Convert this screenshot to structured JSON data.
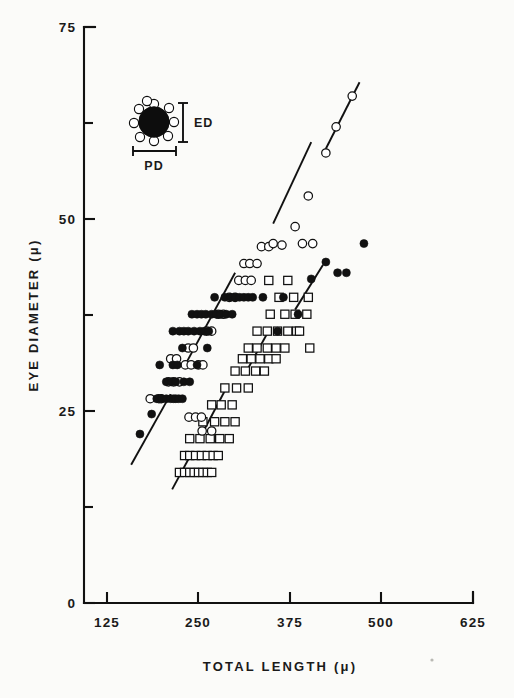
{
  "figure": {
    "background_color": "#fbfbf9",
    "ink_color": "#111111"
  },
  "chart_data": {
    "type": "scatter",
    "title": "",
    "xlabel": "TOTAL LENGTH (μ)",
    "ylabel": "EYE DIAMETER (μ)",
    "xlim": [
      0,
      625
    ],
    "ylim": [
      0,
      75
    ],
    "xticks": [
      125,
      250,
      375,
      500,
      625
    ],
    "xtick_labels": [
      "125",
      "250",
      "375",
      "500",
      "625"
    ],
    "yticks": [
      0,
      25,
      50,
      75
    ],
    "ytick_labels": [
      "0",
      "25",
      "50",
      "75"
    ],
    "yticks_minor": [
      12.5,
      37.5,
      62.5
    ],
    "grid": false,
    "legend": "none",
    "axis_origin_label": "0",
    "series": [
      {
        "name": "filled-circle-series",
        "marker": "filled-circle",
        "color": "#111111",
        "points": [
          [
            170,
            22.0
          ],
          [
            186,
            24.6
          ],
          [
            193,
            26.6
          ],
          [
            200,
            26.6
          ],
          [
            206,
            26.6
          ],
          [
            212,
            26.6
          ],
          [
            216,
            26.6
          ],
          [
            219,
            26.6
          ],
          [
            223,
            26.6
          ],
          [
            228,
            26.6
          ],
          [
            206,
            28.8
          ],
          [
            213,
            28.8
          ],
          [
            219,
            28.8
          ],
          [
            230,
            28.8
          ],
          [
            238,
            28.8
          ],
          [
            197,
            31.0
          ],
          [
            215,
            31.0
          ],
          [
            221,
            31.0
          ],
          [
            248,
            31.0
          ],
          [
            228,
            33.2
          ],
          [
            262,
            33.2
          ],
          [
            215,
            35.4
          ],
          [
            224,
            35.4
          ],
          [
            230,
            35.4
          ],
          [
            236,
            35.4
          ],
          [
            244,
            35.4
          ],
          [
            252,
            35.4
          ],
          [
            258,
            35.4
          ],
          [
            264,
            35.4
          ],
          [
            241,
            37.6
          ],
          [
            248,
            37.6
          ],
          [
            254,
            37.6
          ],
          [
            260,
            37.6
          ],
          [
            268,
            37.6
          ],
          [
            274,
            37.6
          ],
          [
            280,
            37.6
          ],
          [
            288,
            37.6
          ],
          [
            296,
            37.6
          ],
          [
            272,
            39.8
          ],
          [
            286,
            39.8
          ],
          [
            294,
            39.8
          ],
          [
            300,
            39.8
          ],
          [
            306,
            39.8
          ],
          [
            312,
            39.8
          ],
          [
            318,
            39.8
          ],
          [
            324,
            39.8
          ],
          [
            338,
            39.8
          ],
          [
            366,
            39.8
          ],
          [
            404,
            42.2
          ],
          [
            424,
            44.4
          ],
          [
            440,
            43.0
          ],
          [
            452,
            43.0
          ],
          [
            476,
            46.8
          ],
          [
            386,
            37.6
          ],
          [
            358,
            35.4
          ]
        ]
      },
      {
        "name": "open-circle-series",
        "marker": "open-circle",
        "color": "#111111",
        "points": [
          [
            184,
            26.6
          ],
          [
            196,
            26.6
          ],
          [
            199,
            26.6
          ],
          [
            209,
            28.8
          ],
          [
            216,
            28.8
          ],
          [
            224,
            28.8
          ],
          [
            232,
            31.0
          ],
          [
            240,
            31.0
          ],
          [
            250,
            31.0
          ],
          [
            256,
            31.0
          ],
          [
            212,
            31.8
          ],
          [
            220,
            31.8
          ],
          [
            237,
            24.2
          ],
          [
            246,
            24.2
          ],
          [
            254,
            24.2
          ],
          [
            255,
            22.4
          ],
          [
            268,
            22.4
          ],
          [
            236,
            33.2
          ],
          [
            243,
            33.2
          ],
          [
            261,
            35.4
          ],
          [
            268,
            35.4
          ],
          [
            277,
            37.6
          ],
          [
            284,
            37.6
          ],
          [
            292,
            39.8
          ],
          [
            300,
            39.8
          ],
          [
            305,
            42.0
          ],
          [
            314,
            42.0
          ],
          [
            322,
            42.0
          ],
          [
            312,
            44.2
          ],
          [
            320,
            44.2
          ],
          [
            330,
            44.2
          ],
          [
            336,
            46.4
          ],
          [
            346,
            46.4
          ],
          [
            352,
            46.8
          ],
          [
            364,
            46.6
          ],
          [
            382,
            49.0
          ],
          [
            400,
            53.0
          ],
          [
            424,
            58.6
          ],
          [
            438,
            62.0
          ],
          [
            460,
            66.0
          ],
          [
            392,
            46.8
          ],
          [
            406,
            46.8
          ]
        ]
      },
      {
        "name": "open-square-series",
        "marker": "open-square",
        "color": "#111111",
        "points": [
          [
            224,
            17.0
          ],
          [
            231,
            17.0
          ],
          [
            238,
            17.0
          ],
          [
            244,
            17.0
          ],
          [
            250,
            17.0
          ],
          [
            256,
            17.0
          ],
          [
            262,
            17.0
          ],
          [
            268,
            17.0
          ],
          [
            231,
            19.2
          ],
          [
            238,
            19.2
          ],
          [
            246,
            19.2
          ],
          [
            254,
            19.2
          ],
          [
            262,
            19.2
          ],
          [
            270,
            19.2
          ],
          [
            277,
            19.2
          ],
          [
            238,
            21.4
          ],
          [
            252,
            21.4
          ],
          [
            266,
            21.4
          ],
          [
            279,
            21.4
          ],
          [
            292,
            21.4
          ],
          [
            256,
            23.6
          ],
          [
            272,
            23.6
          ],
          [
            286,
            23.6
          ],
          [
            300,
            23.6
          ],
          [
            268,
            25.8
          ],
          [
            281,
            25.8
          ],
          [
            296,
            25.8
          ],
          [
            286,
            28.0
          ],
          [
            302,
            28.0
          ],
          [
            318,
            28.0
          ],
          [
            300,
            30.2
          ],
          [
            314,
            30.2
          ],
          [
            328,
            30.2
          ],
          [
            340,
            30.2
          ],
          [
            310,
            31.8
          ],
          [
            322,
            31.8
          ],
          [
            334,
            31.8
          ],
          [
            346,
            31.8
          ],
          [
            356,
            31.8
          ],
          [
            318,
            33.2
          ],
          [
            330,
            33.2
          ],
          [
            344,
            33.2
          ],
          [
            356,
            33.2
          ],
          [
            368,
            33.2
          ],
          [
            330,
            35.4
          ],
          [
            344,
            35.4
          ],
          [
            358,
            35.4
          ],
          [
            372,
            35.4
          ],
          [
            384,
            35.4
          ],
          [
            348,
            37.6
          ],
          [
            368,
            37.6
          ],
          [
            382,
            37.6
          ],
          [
            398,
            37.6
          ],
          [
            360,
            39.8
          ],
          [
            380,
            39.8
          ],
          [
            400,
            39.8
          ],
          [
            346,
            42.0
          ],
          [
            372,
            42.0
          ],
          [
            388,
            35.4
          ],
          [
            402,
            33.2
          ]
        ]
      }
    ],
    "fit_lines": [
      {
        "name": "upper-regression-line",
        "style": "solid-broken",
        "segments": [
          {
            "x1": 158,
            "y1": 18.0,
            "x2": 212,
            "y2": 27.2
          },
          {
            "x1": 234,
            "y1": 31.4,
            "x2": 300,
            "y2": 43.0
          },
          {
            "x1": 352,
            "y1": 49.4,
            "x2": 404,
            "y2": 60.0
          },
          {
            "x1": 420,
            "y1": 58.4,
            "x2": 470,
            "y2": 67.8
          }
        ]
      },
      {
        "name": "lower-regression-line",
        "style": "solid-broken",
        "segments": [
          {
            "x1": 214,
            "y1": 14.8,
            "x2": 240,
            "y2": 19.4
          },
          {
            "x1": 258,
            "y1": 22.6,
            "x2": 288,
            "y2": 28.0
          },
          {
            "x1": 318,
            "y1": 30.6,
            "x2": 348,
            "y2": 35.8
          },
          {
            "x1": 382,
            "y1": 38.2,
            "x2": 420,
            "y2": 44.0
          }
        ]
      }
    ]
  },
  "inset": {
    "name": "eye-schematic-inset",
    "description": "pigmented eye spot with peripheral photoreceptor beads",
    "ed_label": "ED",
    "pd_label": "PD",
    "bead_count": 9
  }
}
